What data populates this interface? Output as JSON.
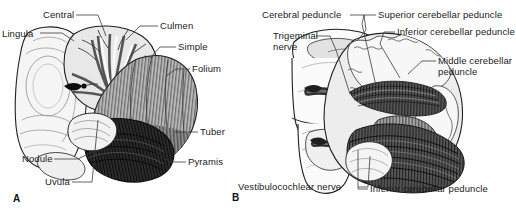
{
  "figure": {
    "width": 516,
    "height": 215,
    "background": "#ffffff",
    "label_color": "#1a1a1a"
  },
  "panels": [
    {
      "letter": "A",
      "name": "cerebellum-posterior-view",
      "labels": [
        {
          "text": "Central",
          "x": 43,
          "y": 10
        },
        {
          "text": "Lingula",
          "x": 2,
          "y": 29
        },
        {
          "text": "Culmen",
          "x": 160,
          "y": 21
        },
        {
          "text": "Simple",
          "x": 178,
          "y": 42
        },
        {
          "text": "Folium",
          "x": 192,
          "y": 64
        },
        {
          "text": "Tuber",
          "x": 200,
          "y": 127
        },
        {
          "text": "Pyramis",
          "x": 188,
          "y": 157
        },
        {
          "text": "Nodule",
          "x": 22,
          "y": 154
        },
        {
          "text": "Uvula",
          "x": 45,
          "y": 177
        }
      ]
    },
    {
      "letter": "B",
      "name": "cerebellar-peduncles-view",
      "labels": [
        {
          "text": "Cerebral peduncle",
          "x": 4,
          "y": 10
        },
        {
          "text": "Trigeminal",
          "x": 15,
          "y": 31
        },
        {
          "text": "nerve",
          "x": 15,
          "y": 42
        },
        {
          "text": "Superior cerebellar peduncle",
          "x": 120,
          "y": 10
        },
        {
          "text": "Inferior cerebellar peduncle",
          "x": 139,
          "y": 27
        },
        {
          "text": "Middle cerebellar",
          "x": 180,
          "y": 56
        },
        {
          "text": "peduncle",
          "x": 180,
          "y": 67
        },
        {
          "text": "Vestibulocochlear nerve",
          "x": -20,
          "y": 182
        },
        {
          "text": "Inferior cerebellar peduncle",
          "x": 112,
          "y": 184
        }
      ]
    }
  ],
  "palette": {
    "outline": "#1c1c1c",
    "line": "#3a3a3a",
    "pale": "#f2f2f2",
    "light_gray": "#d8d8d8",
    "mid_gray": "#a9a9a9",
    "dark_gray": "#6a6a6a",
    "darker_gray": "#3f3f3f",
    "near_black": "#1a1a1a",
    "white": "#ffffff"
  }
}
